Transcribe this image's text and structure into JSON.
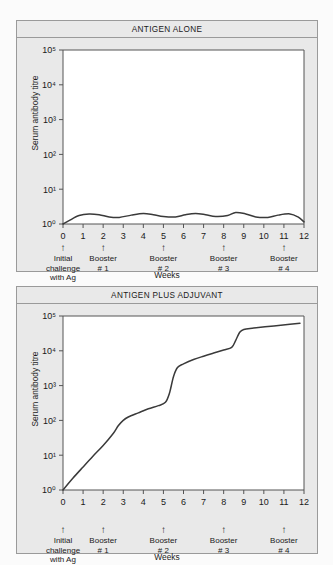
{
  "figure": {
    "background_color": "#fbfbfb",
    "panel_color": "#e9e9e9",
    "plot_color": "#ffffff",
    "line_color": "#3a3a3a",
    "border_color": "#9a9a9a"
  },
  "panels": [
    {
      "title": "ANTIGEN ALONE",
      "ylabel": "Serum antibody titre",
      "xlabel": "Weeks"
    },
    {
      "title": "ANTIGEN PLUS ADJUVANT",
      "ylabel": "Serum antibody titre",
      "xlabel": "Weeks"
    }
  ],
  "axis": {
    "y_ticks": [
      "10⁰",
      "10¹",
      "10²",
      "10³",
      "10⁴",
      "10⁵"
    ],
    "x_ticks": [
      "0",
      "1",
      "2",
      "3",
      "4",
      "5",
      "6",
      "7",
      "8",
      "9",
      "10",
      "11",
      "12"
    ]
  },
  "annotations": [
    {
      "arrow": "↑",
      "week": 0,
      "text": "Initial\nchallenge\nwith Ag"
    },
    {
      "arrow": "↑",
      "week": 2,
      "text": "Booster\n# 1"
    },
    {
      "arrow": "↑",
      "week": 5,
      "text": "Booster\n# 2"
    },
    {
      "arrow": "↑",
      "week": 8,
      "text": "Booster\n# 3"
    },
    {
      "arrow": "↑",
      "week": 11,
      "text": "Booster\n# 4"
    }
  ],
  "chart_data": [
    {
      "type": "line",
      "title": "ANTIGEN ALONE",
      "xlabel": "Weeks",
      "ylabel": "Serum antibody titre",
      "yscale": "log",
      "ylim": [
        1,
        100000
      ],
      "xlim": [
        0,
        12
      ],
      "grid": false,
      "legend": null,
      "series": [
        {
          "name": "Antigen alone",
          "x": [
            0,
            0.3,
            0.8,
            1.3,
            1.8,
            2.3,
            2.8,
            3.4,
            4.0,
            4.5,
            5.0,
            5.6,
            6.1,
            6.6,
            7.1,
            7.6,
            8.2,
            8.6,
            9.1,
            9.6,
            10.2,
            10.7,
            11.3,
            11.7,
            12.0
          ],
          "y": [
            1.0,
            1.25,
            1.75,
            1.95,
            1.85,
            1.6,
            1.55,
            1.8,
            2.0,
            1.85,
            1.65,
            1.6,
            1.85,
            2.0,
            1.85,
            1.65,
            1.75,
            2.15,
            1.95,
            1.6,
            1.55,
            1.8,
            1.95,
            1.6,
            1.15
          ]
        }
      ]
    },
    {
      "type": "line",
      "title": "ANTIGEN PLUS ADJUVANT",
      "xlabel": "Weeks",
      "ylabel": "Serum antibody titre",
      "yscale": "log",
      "ylim": [
        1,
        100000
      ],
      "xlim": [
        0,
        12
      ],
      "grid": false,
      "legend": null,
      "series": [
        {
          "name": "Antigen plus adjuvant",
          "x": [
            0,
            0.5,
            1.0,
            1.5,
            2.0,
            2.5,
            2.75,
            3.0,
            3.25,
            3.75,
            4.25,
            4.75,
            5.1,
            5.3,
            5.5,
            5.7,
            6.0,
            6.5,
            7.0,
            7.5,
            8.0,
            8.4,
            8.6,
            8.8,
            9.0,
            9.5,
            10.5,
            11.3,
            11.8
          ],
          "y": [
            1.0,
            2.2,
            4.6,
            9.5,
            19,
            42,
            70,
            100,
            125,
            165,
            215,
            265,
            330,
            600,
            1800,
            3300,
            4200,
            5600,
            7000,
            8600,
            10500,
            12500,
            20000,
            34000,
            41000,
            45000,
            52000,
            58000,
            62000
          ]
        }
      ]
    }
  ]
}
